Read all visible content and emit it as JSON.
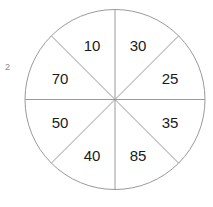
{
  "figure": {
    "index_label": "2",
    "type": "spinner-wheel",
    "background_color": "#ffffff",
    "stroke_color": "#9a9a9a",
    "text_color": "#1a1a1a",
    "index_color": "#8a8a8a"
  },
  "chart_data": {
    "type": "pie",
    "title": "",
    "subtitle": "",
    "xlabel": "",
    "ylabel": "",
    "grid": false,
    "legend": "none",
    "equal_sectors": true,
    "sector_count": 8,
    "sector_angle_degrees": 45,
    "categories": [
      "30",
      "25",
      "35",
      "85",
      "40",
      "50",
      "70",
      "10"
    ],
    "values": [
      12.5,
      12.5,
      12.5,
      12.5,
      12.5,
      12.5,
      12.5,
      12.5
    ],
    "labels": [
      "30",
      "25",
      "35",
      "85",
      "40",
      "50",
      "70",
      "10"
    ],
    "annotations": [
      "2"
    ],
    "geometry": {
      "center_x": 115,
      "center_y": 99.5,
      "radius": 90,
      "stroke_width": 1
    },
    "sectors": [
      {
        "label": "30",
        "start_deg": 270,
        "end_deg": 315,
        "mid_deg": 292.5,
        "label_x": 115,
        "label_y": 99.5,
        "text_x": 138,
        "text_y": 45
      },
      {
        "label": "25",
        "start_deg": 315,
        "end_deg": 0,
        "mid_deg": 337.5,
        "label_x": 115,
        "label_y": 99.5,
        "text_x": 170,
        "text_y": 78
      },
      {
        "label": "35",
        "start_deg": 0,
        "end_deg": 45,
        "mid_deg": 22.5,
        "label_x": 115,
        "label_y": 99.5,
        "text_x": 170,
        "text_y": 122
      },
      {
        "label": "85",
        "start_deg": 45,
        "end_deg": 90,
        "mid_deg": 67.5,
        "label_x": 115,
        "label_y": 99.5,
        "text_x": 138,
        "text_y": 155
      },
      {
        "label": "40",
        "start_deg": 90,
        "end_deg": 135,
        "mid_deg": 112.5,
        "label_x": 115,
        "label_y": 99.5,
        "text_x": 92,
        "text_y": 155
      },
      {
        "label": "50",
        "start_deg": 135,
        "end_deg": 180,
        "mid_deg": 157.5,
        "label_x": 115,
        "label_y": 99.5,
        "text_x": 60,
        "text_y": 122
      },
      {
        "label": "70",
        "start_deg": 180,
        "end_deg": 225,
        "mid_deg": 202.5,
        "label_x": 115,
        "label_y": 99.5,
        "text_x": 60,
        "text_y": 78
      },
      {
        "label": "10",
        "start_deg": 225,
        "end_deg": 270,
        "mid_deg": 247.5,
        "label_x": 115,
        "label_y": 99.5,
        "text_x": 92,
        "text_y": 45
      }
    ]
  }
}
